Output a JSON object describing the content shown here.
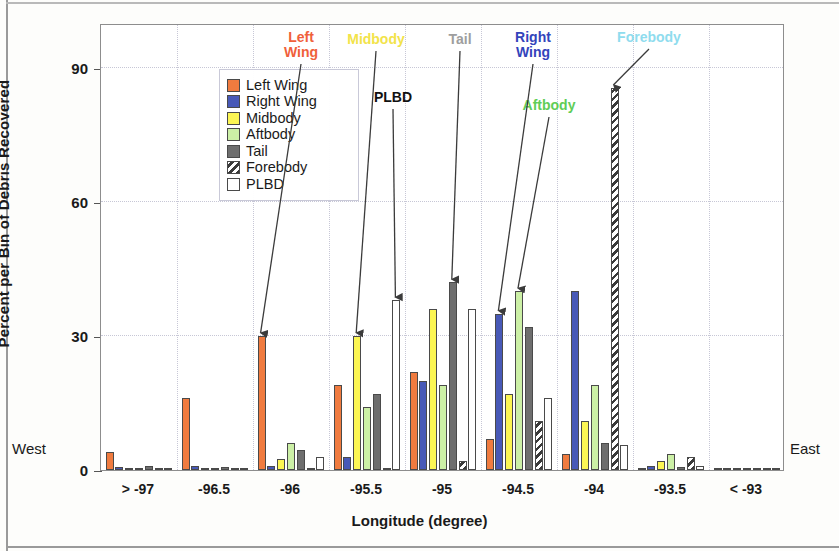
{
  "chart_data": {
    "type": "bar",
    "title": "",
    "xlabel": "Longitude (degree)",
    "ylabel": "Percent per Bin of Debris Recovered",
    "ylim": [
      0,
      100
    ],
    "yticks": [
      0,
      30,
      60,
      90
    ],
    "grid": true,
    "legend_position": "upper-left inside plot",
    "categories": [
      "> -97",
      "-96.5",
      "-96",
      "-95.5",
      "-95",
      "-94.5",
      "-94",
      "-93.5",
      "< -93"
    ],
    "series": [
      {
        "name": "Left Wing",
        "color": "#f07b3f",
        "values": [
          4,
          16,
          30,
          19,
          22,
          7,
          3.5,
          0.4,
          0.3
        ]
      },
      {
        "name": "Right Wing",
        "color": "#4859b7",
        "values": [
          0.6,
          0.8,
          1,
          3,
          20,
          35,
          40,
          0.8,
          0.3
        ]
      },
      {
        "name": "Midbody",
        "color": "#fcf653",
        "values": [
          0.4,
          0.3,
          2.5,
          30,
          36,
          17,
          11,
          2,
          0.2
        ]
      },
      {
        "name": "Aftbody",
        "color": "#ccf0a6",
        "values": [
          0.3,
          0.3,
          6,
          14,
          19,
          40,
          19,
          3.5,
          0.3
        ]
      },
      {
        "name": "Tail",
        "color": "#6e6e6e",
        "values": [
          0.8,
          0.6,
          4.5,
          17,
          42,
          32,
          6,
          0.6,
          0.4
        ]
      },
      {
        "name": "Forebody",
        "color": "#3a3a3a",
        "values": [
          0.3,
          0.3,
          0.4,
          0.4,
          2,
          11,
          85.5,
          3,
          0.3
        ]
      },
      {
        "name": "PLBD",
        "color": "#ffffff",
        "values": [
          0.3,
          0.3,
          3,
          38,
          36,
          16,
          5.5,
          1,
          0.3
        ]
      }
    ],
    "annotations": [
      {
        "label": "Left\nWing",
        "color": "#f0603a"
      },
      {
        "label": "Midbody",
        "color": "#f2e34a"
      },
      {
        "label": "PLBD",
        "color": "#111111"
      },
      {
        "label": "Tail",
        "color": "#9e9e9e"
      },
      {
        "label": "Right\nWing",
        "color": "#3344bb"
      },
      {
        "label": "Aftbody",
        "color": "#5fcd57"
      },
      {
        "label": "Forebody",
        "color": "#8fdcee"
      }
    ],
    "compass_west": "West",
    "compass_east": "East"
  },
  "legend": {
    "items": [
      {
        "label": "Left Wing"
      },
      {
        "label": "Right Wing"
      },
      {
        "label": "Midbody"
      },
      {
        "label": "Aftbody"
      },
      {
        "label": "Tail"
      },
      {
        "label": "Forebody"
      },
      {
        "label": "PLBD"
      }
    ]
  }
}
